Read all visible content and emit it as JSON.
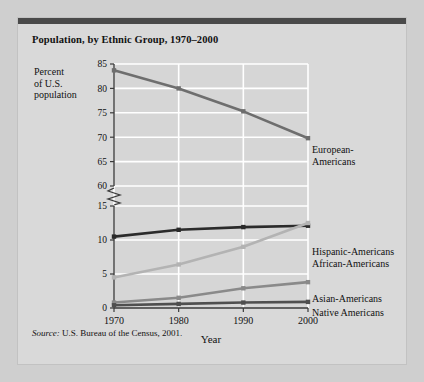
{
  "card": {
    "title": "Population, by Ethnic Group, 1970–2000",
    "source_prefix": "Source:",
    "source_text": " U.S. Bureau of the Census, 2001."
  },
  "axis": {
    "y_title_line1": "Percent",
    "y_title_line2": "of U.S.",
    "y_title_line3": "population",
    "x_title": "Year"
  },
  "colors": {
    "page_bg": "#cfcfcf",
    "card_bg": "#d9d9d9",
    "top_bar": "#4a4a4a",
    "plot_bg": "#d6d6d6",
    "grid": "#ffffff",
    "axis": "#3a3a3a",
    "european": "#6e6e6e",
    "african": "#2b2b2b",
    "hispanic": "#b3b3b3",
    "asian": "#8a8a8a",
    "native": "#4f4f4f"
  },
  "chart_data": {
    "type": "line",
    "title": "Population, by Ethnic Group, 1970–2000",
    "xlabel": "Year",
    "ylabel": "Percent of U.S. population",
    "x": [
      1970,
      1980,
      1990,
      2000
    ],
    "xticklabels": [
      "1970",
      "1980",
      "1990",
      "2000"
    ],
    "yticklabels": [
      "0",
      "5",
      "10",
      "15",
      "60",
      "65",
      "70",
      "75",
      "80",
      "85"
    ],
    "ylim_lower": [
      0,
      15
    ],
    "ylim_upper": [
      60,
      85
    ],
    "axis_break": true,
    "grid": true,
    "legend_position": "right-inline",
    "series": [
      {
        "name": "European-Americans",
        "values": [
          83.7,
          80.0,
          75.3,
          69.8
        ],
        "color": "#6e6e6e"
      },
      {
        "name": "African-Americans",
        "values": [
          10.5,
          11.5,
          11.9,
          12.1
        ],
        "color": "#2b2b2b"
      },
      {
        "name": "Hispanic-Americans",
        "values": [
          4.5,
          6.4,
          9.0,
          12.5
        ],
        "color": "#b3b3b3"
      },
      {
        "name": "Asian-Americans",
        "values": [
          0.8,
          1.5,
          2.9,
          3.8
        ],
        "color": "#8a8a8a"
      },
      {
        "name": "Native Americans",
        "values": [
          0.4,
          0.6,
          0.8,
          0.9
        ],
        "color": "#4f4f4f"
      }
    ]
  },
  "legend": {
    "european": "European-",
    "european2": "Americans",
    "hispanic": "Hispanic-Americans",
    "african": "African-Americans",
    "asian": "Asian-Americans",
    "native": "Native Americans"
  }
}
